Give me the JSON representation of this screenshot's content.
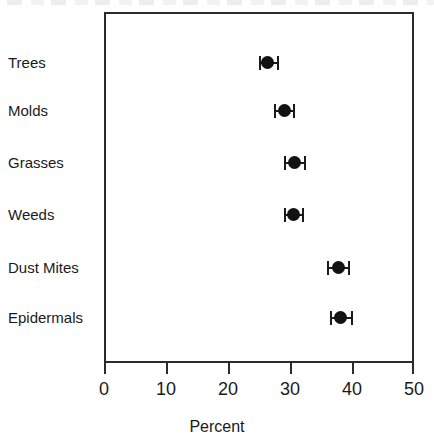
{
  "chart_data": {
    "type": "scatter",
    "title": "",
    "subtitle": "",
    "xlabel": "Percent",
    "ylabel": "",
    "xlim": [
      0,
      50
    ],
    "xticks": [
      0,
      10,
      20,
      30,
      40,
      50
    ],
    "xtick_labels": [
      "0",
      "10",
      "20",
      "30",
      "40",
      "50"
    ],
    "grid": false,
    "legend": null,
    "orientation": "horizontal",
    "error_bars": "confidence interval",
    "categories": [
      "Trees",
      "Molds",
      "Grasses",
      "Weeds",
      "Dust Mites",
      "Epidermals"
    ],
    "values": [
      26.3,
      29.1,
      30.8,
      30.6,
      37.8,
      38.2
    ],
    "ci_low": [
      25.0,
      27.4,
      29.1,
      29.0,
      36.0,
      36.4
    ],
    "ci_high": [
      28.2,
      30.8,
      32.5,
      32.2,
      39.7,
      40.2
    ],
    "points": [
      {
        "category": "Trees",
        "value": 26.3,
        "ci_low": 25.0,
        "ci_high": 28.2
      },
      {
        "category": "Molds",
        "value": 29.1,
        "ci_low": 27.4,
        "ci_high": 30.8
      },
      {
        "category": "Grasses",
        "value": 30.8,
        "ci_low": 29.1,
        "ci_high": 32.5
      },
      {
        "category": "Weeds",
        "value": 30.6,
        "ci_low": 29.0,
        "ci_high": 32.2
      },
      {
        "category": "Dust Mites",
        "value": 37.8,
        "ci_low": 36.0,
        "ci_high": 39.7
      },
      {
        "category": "Epidermals",
        "value": 38.2,
        "ci_low": 36.4,
        "ci_high": 40.2
      }
    ],
    "colors": {
      "marker": "#121212",
      "error_bar": "#1a1a1a",
      "axis": "#2b2b2b",
      "background": "#ffffff",
      "text": "#1a1a1a"
    }
  }
}
